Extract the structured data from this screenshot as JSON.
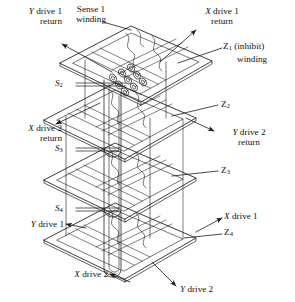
{
  "figure": {
    "plane_count": 4,
    "core_grid": "3x3 toroidal cores per plane shown"
  },
  "labels": {
    "y_drive_1_return": {
      "line1": "Y",
      "line2": "drive 1",
      "line3": "return"
    },
    "sense_1_winding": {
      "line1": "Sense 1",
      "line2": "winding"
    },
    "x_drive_1_return": {
      "line1": "X",
      "line2": "drive 1",
      "line3": "return"
    },
    "z1_inhibit_winding": {
      "z": "Z",
      "sub": "1",
      "paren": "(inhibit)",
      "line2": "winding"
    },
    "s2": {
      "s": "S",
      "sub": "2"
    },
    "z2": {
      "z": "Z",
      "sub": "2"
    },
    "x_drive_2_return": {
      "line1": "X",
      "line2": "drive 2",
      "line3": "return"
    },
    "y_drive_2_return": {
      "line1": "Y",
      "line2": "drive 2",
      "line3": "return"
    },
    "s3": {
      "s": "S",
      "sub": "3"
    },
    "z3": {
      "z": "Z",
      "sub": "3"
    },
    "s4": {
      "s": "S",
      "sub": "4"
    },
    "x_drive_1": {
      "line1": "X",
      "line2": "drive 1"
    },
    "y_drive_1": {
      "line1": "Y",
      "line2": "drive 1"
    },
    "z4": {
      "z": "Z",
      "sub": "4"
    },
    "x_drive_2": {
      "line1": "X",
      "line2": "drive 2"
    },
    "y_drive_2": {
      "line1": "Y",
      "line2": "drive 2"
    }
  },
  "colors": {
    "stroke": "#1a1a1a",
    "background": "#ffffff",
    "text": "#111111"
  }
}
